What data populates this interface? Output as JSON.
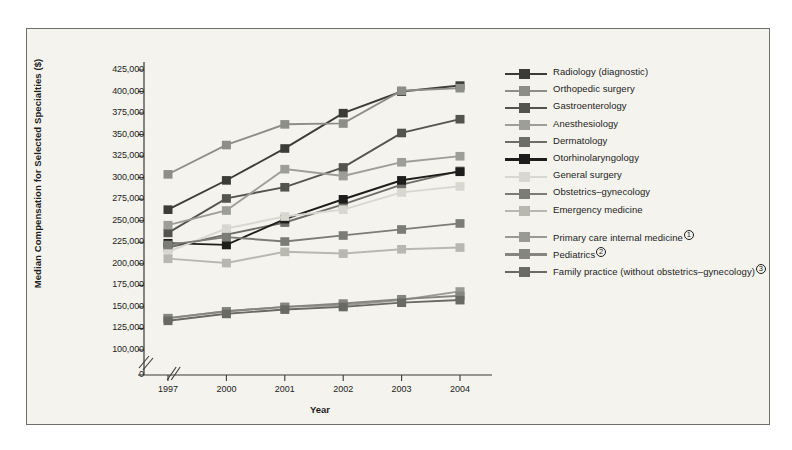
{
  "figure": {
    "background": "#f4f3ee",
    "border_color": "#6f6f6a"
  },
  "chart_data": {
    "type": "line",
    "title": "",
    "xlabel": "Year",
    "ylabel": "Median Compensation for Selected Specialties ($)",
    "categories": [
      "1997",
      "2000",
      "2001",
      "2002",
      "2003",
      "2004"
    ],
    "x_axis_break": true,
    "y_axis_break": true,
    "grid": false,
    "legend_position": "right",
    "ylim": [
      0,
      425000
    ],
    "yticks": [
      0,
      100000,
      125000,
      150000,
      175000,
      200000,
      225000,
      250000,
      275000,
      300000,
      325000,
      350000,
      375000,
      400000,
      425000
    ],
    "ytick_labels": [
      "0",
      "100,000",
      "125,000",
      "150,000",
      "175,000",
      "200,000",
      "225,000",
      "250,000",
      "275,000",
      "300,000",
      "325,000",
      "350,000",
      "375,000",
      "400,000",
      "425,000"
    ],
    "series": [
      {
        "name": "Radiology (diagnostic)",
        "color": "#3b3b38",
        "values": [
          263000,
          297000,
          334000,
          375000,
          400000,
          407000
        ]
      },
      {
        "name": "Orthopedic surgery",
        "color": "#8e8e88",
        "values": [
          304000,
          338000,
          362000,
          363000,
          401000,
          404000
        ]
      },
      {
        "name": "Gastroenterology",
        "color": "#54544f",
        "values": [
          236000,
          276000,
          289000,
          312000,
          352000,
          368000
        ]
      },
      {
        "name": "Anesthesiology",
        "color": "#9e9e98",
        "values": [
          245000,
          262000,
          310000,
          302000,
          318000,
          325000
        ]
      },
      {
        "name": "Dermatology",
        "color": "#6e6e68",
        "values": [
          219000,
          234000,
          248000,
          269000,
          292000,
          308000
        ]
      },
      {
        "name": "Otorhinolaryngology",
        "color": "#1d1d1b",
        "values": [
          224000,
          222000,
          252000,
          275000,
          297000,
          307000
        ]
      },
      {
        "name": "General surgery",
        "color": "#d9d8d0",
        "values": [
          214000,
          241000,
          255000,
          263000,
          283000,
          290000
        ]
      },
      {
        "name": "Obstetrics–gynecology",
        "color": "#7c7c76",
        "values": [
          222000,
          231000,
          226000,
          233000,
          240000,
          247000
        ]
      },
      {
        "name": "Emergency medicine",
        "color": "#b8b8b1",
        "values": [
          206000,
          201000,
          214000,
          212000,
          217000,
          219000
        ]
      },
      {
        "name": "Primary care internal medicine",
        "superscript": "1",
        "color": "#9a9a94",
        "values": [
          137000,
          145000,
          150000,
          152000,
          158000,
          168000
        ]
      },
      {
        "name": "Pediatrics",
        "superscript": "2",
        "color": "#868680",
        "values": [
          137000,
          145000,
          150000,
          154000,
          159000,
          163000
        ]
      },
      {
        "name": "Family practice (without obstetrics–gynecology)",
        "superscript": "3",
        "color": "#6a6a64",
        "values": [
          134000,
          142000,
          147000,
          150000,
          155000,
          158000
        ]
      }
    ]
  },
  "legend": [
    {
      "label": "Radiology (diagnostic)",
      "color": "#3b3b38",
      "group": 0
    },
    {
      "label": "Orthopedic surgery",
      "color": "#8e8e88",
      "group": 0
    },
    {
      "label": "Gastroenterology",
      "color": "#54544f",
      "group": 0
    },
    {
      "label": "Anesthesiology",
      "color": "#9e9e98",
      "group": 0
    },
    {
      "label": "Dermatology",
      "color": "#6e6e68",
      "group": 0
    },
    {
      "label": "Otorhinolaryngology",
      "color": "#1d1d1b",
      "group": 0
    },
    {
      "label": "General surgery",
      "color": "#d9d8d0",
      "group": 0
    },
    {
      "label": "Obstetrics–gynecology",
      "color": "#7c7c76",
      "group": 0
    },
    {
      "label": "Emergency medicine",
      "color": "#b8b8b1",
      "group": 0
    },
    {
      "label": "Primary care internal medicine",
      "superscript": "1",
      "color": "#9a9a94",
      "group": 1
    },
    {
      "label": "Pediatrics",
      "superscript": "2",
      "color": "#868680",
      "group": 1
    },
    {
      "label": "Family practice (without obstetrics–gynecology)",
      "superscript": "3",
      "color": "#6a6a64",
      "group": 1
    }
  ]
}
